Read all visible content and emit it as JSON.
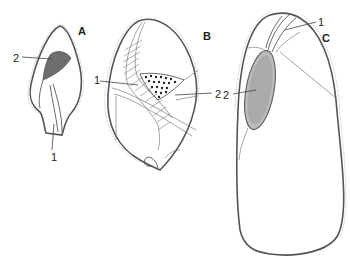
{
  "figure": {
    "panels": [
      {
        "id": "A",
        "label": "A",
        "callouts": [
          {
            "number": "2",
            "target": "dense stippled region"
          },
          {
            "number": "1",
            "target": "elongated structure at base"
          }
        ]
      },
      {
        "id": "B",
        "label": "B",
        "callouts": [
          {
            "number": "1",
            "target": "hatched band"
          },
          {
            "number": "2",
            "target": "dotted region"
          }
        ]
      },
      {
        "id": "C",
        "label": "C",
        "callouts": [
          {
            "number": "1",
            "target": "forked structure at top"
          },
          {
            "number": "2",
            "target": "stippled oval body"
          }
        ]
      }
    ],
    "colors": {
      "ink": "#444444",
      "background": "#ffffff"
    }
  }
}
